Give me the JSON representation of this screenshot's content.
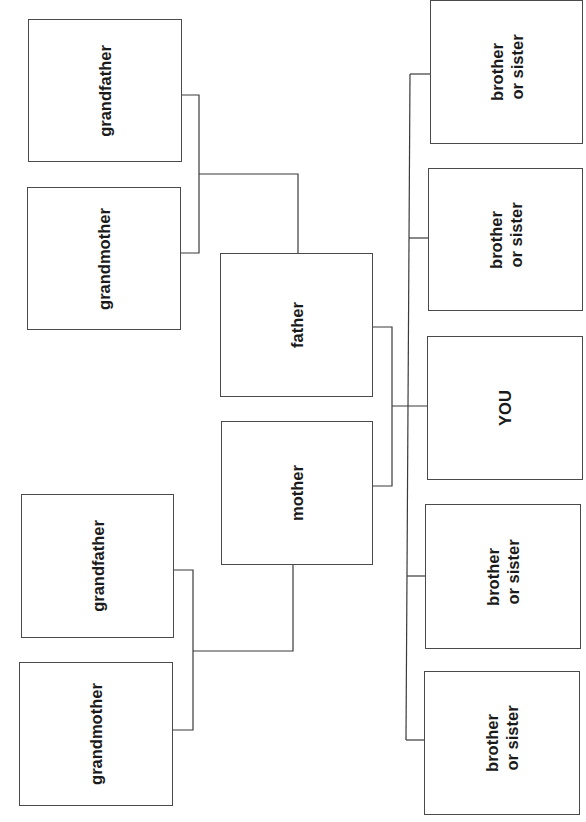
{
  "diagram": {
    "type": "family-tree",
    "orientation": "rotated-90-ccw",
    "colors": {
      "line": "#3a3a3a",
      "border": "#4a4a4a",
      "text": "#1a1a1a",
      "background": "#ffffff"
    },
    "nodes": {
      "paternal_grandfather": {
        "label": "grandfather"
      },
      "paternal_grandmother": {
        "label": "grandmother"
      },
      "father": {
        "label": "father"
      },
      "mother": {
        "label": "mother"
      },
      "maternal_grandfather": {
        "label": "grandfather"
      },
      "maternal_grandmother": {
        "label": "grandmother"
      },
      "sibling_1": {
        "line1": "brother",
        "line2": "or sister"
      },
      "sibling_2": {
        "line1": "brother",
        "line2": "or sister"
      },
      "you": {
        "label": "YOU"
      },
      "sibling_4": {
        "line1": "brother",
        "line2": "or sister"
      },
      "sibling_5": {
        "line1": "brother",
        "line2": "or sister"
      }
    },
    "edges": [
      {
        "from": [
          "paternal_grandfather",
          "paternal_grandmother"
        ],
        "to": "father"
      },
      {
        "from": [
          "maternal_grandfather",
          "maternal_grandmother"
        ],
        "to": "mother"
      },
      {
        "from": [
          "father",
          "mother"
        ],
        "to": [
          "sibling_1",
          "sibling_2",
          "you",
          "sibling_4",
          "sibling_5"
        ]
      }
    ]
  }
}
